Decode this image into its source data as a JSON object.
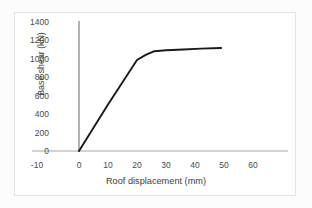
{
  "chart_data": {
    "type": "line",
    "title": "",
    "xlabel": "Roof displacement (mm)",
    "ylabel": "Base shear (kN)",
    "xlim": [
      -10,
      60
    ],
    "ylim": [
      0,
      1400
    ],
    "xticks": [
      "-10",
      "0",
      "10",
      "20",
      "30",
      "40",
      "50",
      "60"
    ],
    "yticks": [
      "0",
      "200",
      "400",
      "600",
      "800",
      "1000",
      "1200",
      "1400"
    ],
    "xtick_values": [
      -10,
      0,
      10,
      20,
      30,
      40,
      50,
      60
    ],
    "ytick_values": [
      0,
      200,
      400,
      600,
      800,
      1000,
      1200,
      1400
    ],
    "grid": false,
    "legend": null,
    "series": [
      {
        "name": "Pushover curve",
        "color": "#1a1a1a",
        "x": [
          0,
          5,
          10,
          15,
          20,
          23,
          26,
          30,
          36,
          42,
          49
        ],
        "values": [
          0,
          250,
          500,
          740,
          980,
          1035,
          1075,
          1085,
          1093,
          1102,
          1110
        ]
      }
    ],
    "annotations": []
  },
  "axes": {
    "y_axis_color": "#808080",
    "x_axis_color": "#a6a6a6"
  },
  "frame": {
    "border_color": "#e3e3e3",
    "background": "#ffffff"
  }
}
